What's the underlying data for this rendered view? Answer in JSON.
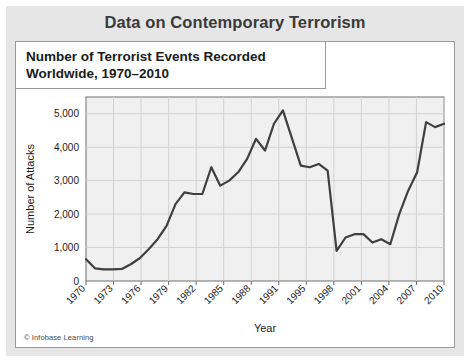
{
  "banner": {
    "title": "Data on Contemporary Terrorism"
  },
  "figure": {
    "heading_line1": "Number of Terrorist Events Recorded",
    "heading_line2": "Worldwide, 1970–2010",
    "credit": "© Infobase Learning"
  },
  "colors": {
    "mat": "#e6e6e6",
    "card": "#ffffff",
    "plot_bg": "#f0f0f0",
    "grid": "#d2d2d2",
    "line": "#3f3f3f",
    "axis": "#6e6e6e",
    "title_text": "#3a3a3a",
    "heading_text": "#1b1b1b"
  },
  "chart_data": {
    "type": "line",
    "title": "Number of Terrorist Events Recorded Worldwide, 1970–2010",
    "xlabel": "Year",
    "ylabel": "Number of Attacks",
    "ylim": [
      0,
      5500
    ],
    "yticks": [
      0,
      1000,
      2000,
      3000,
      4000,
      5000
    ],
    "ytick_labels": [
      "0",
      "1,000",
      "2,000",
      "3,000",
      "4,000",
      "5,000"
    ],
    "xtick_labels": [
      "1970",
      "1973",
      "1976",
      "1979",
      "1982",
      "1985",
      "1988",
      "1991",
      "1995",
      "1998",
      "2001",
      "2004",
      "2007",
      "2010"
    ],
    "grid": true,
    "legend": "none",
    "series": [
      {
        "name": "Number of Attacks",
        "x": [
          1970,
          1971,
          1972,
          1973,
          1974,
          1975,
          1976,
          1977,
          1978,
          1979,
          1980,
          1981,
          1982,
          1983,
          1984,
          1985,
          1986,
          1987,
          1988,
          1989,
          1990,
          1991,
          1992,
          1994,
          1995,
          1996,
          1997,
          1998,
          1999,
          2000,
          2001,
          2002,
          2003,
          2004,
          2005,
          2006,
          2007,
          2008,
          2009,
          2010
        ],
        "values": [
          650,
          380,
          350,
          350,
          360,
          500,
          680,
          950,
          1250,
          1650,
          2300,
          2650,
          2600,
          2600,
          3400,
          2850,
          3000,
          3250,
          3650,
          4250,
          3900,
          4700,
          5100,
          3450,
          3400,
          3500,
          3300,
          900,
          1300,
          1400,
          1400,
          1150,
          1250,
          1100,
          2000,
          2700,
          3250,
          4750,
          4600,
          4700
        ]
      }
    ]
  }
}
